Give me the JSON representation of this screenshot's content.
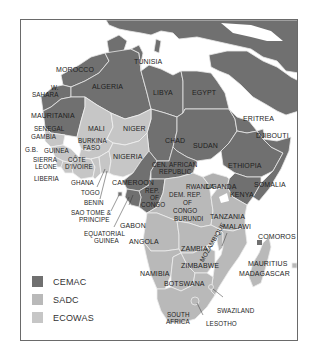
{
  "colors": {
    "cemac": "#707070",
    "sadc": "#b9b9b9",
    "ecowas": "#c6c6c6",
    "non_member": "#707070",
    "sea": "#ffffff",
    "border": "#e8e8e8",
    "frame": "#6a6a6a"
  },
  "legend": {
    "items": [
      {
        "label": "CEMAC",
        "color": "#707070"
      },
      {
        "label": "SADC",
        "color": "#b9b9b9"
      },
      {
        "label": "ECOWAS",
        "color": "#c6c6c6"
      }
    ]
  },
  "labels": {
    "morocco": "MOROCCO",
    "tunisia": "TUNISIA",
    "w_sahara_1": "W.",
    "w_sahara_2": "SAHARA",
    "algeria": "ALGERIA",
    "libya": "LIBYA",
    "egypt": "EGYPT",
    "mauritania": "MAURITANIA",
    "eritrea": "ERITREA",
    "djibouti": "DJIBOUTI",
    "mali": "MALI",
    "niger": "NIGER",
    "senegal": "SENEGAL",
    "gambia": "GAMBIA",
    "burkina_1": "BURKINA",
    "burkina_2": "FASO",
    "chad": "CHAD",
    "sudan": "SUDAN",
    "gb": "G.B.",
    "guinea": "GUINEA",
    "nigeria": "NIGERIA",
    "ethiopia": "ETHIOPIA",
    "sierra_1": "SIERRA",
    "sierra_2": "LEONE",
    "cote_1": "CÔTE",
    "cote_2": "D'IVOIRE",
    "car_1": "CEN. AFRICAN",
    "car_2": "REPUBLIC",
    "liberia": "LIBERIA",
    "somalia": "SOMALIA",
    "ghana": "GHANA",
    "cameroon": "CAMEROON",
    "rwanda": "RWANDA",
    "uganda": "UGANDA",
    "togo": "TOGO",
    "rep_congo_1": "REP.",
    "rep_congo_2": "OF",
    "rep_congo_3": "CONGO",
    "drc_1": "DEM. REP.",
    "drc_2": "OF",
    "drc_3": "CONGO",
    "kenya": "KENYA",
    "benin": "BENIN",
    "burundi": "BURUNDI",
    "sao_tome_1": "SAO TOME &",
    "sao_tome_2": "PRINCIPE",
    "tanzania": "TANZANIA",
    "gabon": "GABON",
    "eq_guinea_1": "EQUATORIAL",
    "eq_guinea_2": "GUINEA",
    "malawi": "MALAWI",
    "comoros": "COMOROS",
    "angola": "ANGOLA",
    "zambia": "ZAMBIA",
    "mauritius": "MAURITIUS",
    "madagascar": "MADAGASCAR",
    "namibia": "NAMIBIA",
    "zimbabwe": "ZIMBABWE",
    "mozambique": "MOZAMBIQUE",
    "botswana": "BOTSWANA",
    "swaziland": "SWAZILAND",
    "south_africa_1": "SOUTH",
    "south_africa_2": "AFRICA",
    "lesotho": "LESOTHO"
  }
}
